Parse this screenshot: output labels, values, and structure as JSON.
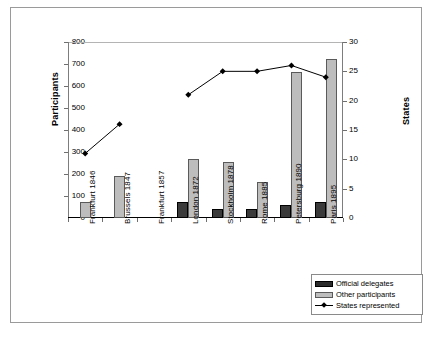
{
  "chart_data": {
    "type": "bar",
    "title": "",
    "categories": [
      "Frankfurt 1846",
      "Brussels 1847",
      "Frankfurt 1857",
      "London 1872",
      "Stockholm 1878",
      "Rome 1885",
      "Petersburg 1890",
      "Paris 1895"
    ],
    "xlabel": "",
    "ylabel": "Participants",
    "ylabel_secondary": "States",
    "ylim": [
      0,
      800
    ],
    "ylim_secondary": [
      0,
      30
    ],
    "yticks": [
      0,
      100,
      200,
      300,
      400,
      500,
      600,
      700,
      800
    ],
    "yticks_secondary": [
      0,
      5,
      10,
      15,
      20,
      25,
      30
    ],
    "grid": false,
    "legend_position": "bottom-right",
    "series": [
      {
        "name": "Official delegates",
        "type": "bar",
        "axis": "left",
        "color": "#3a3a3a",
        "values": [
          null,
          null,
          null,
          75,
          40,
          40,
          58,
          75
        ]
      },
      {
        "name": "Other participants",
        "type": "bar",
        "axis": "left",
        "color": "#bdbdbd",
        "values": [
          75,
          190,
          null,
          270,
          255,
          165,
          665,
          725
        ]
      },
      {
        "name": "States represented",
        "type": "line",
        "axis": "right",
        "color": "#000000",
        "values": [
          11,
          16,
          null,
          21,
          25,
          25,
          26,
          24
        ]
      }
    ]
  },
  "axis": {
    "left_label": "Participants",
    "right_label": "States",
    "left_ticks": [
      "800",
      "700",
      "600",
      "500",
      "400",
      "300",
      "200",
      "100",
      "0"
    ],
    "right_ticks": [
      "30",
      "25",
      "20",
      "15",
      "10",
      "5",
      "0"
    ]
  },
  "legend": {
    "items": [
      {
        "label": "Official delegates",
        "swatch": "official"
      },
      {
        "label": "Other participants",
        "swatch": "other"
      },
      {
        "label": "States represented",
        "swatch": "line"
      }
    ]
  }
}
